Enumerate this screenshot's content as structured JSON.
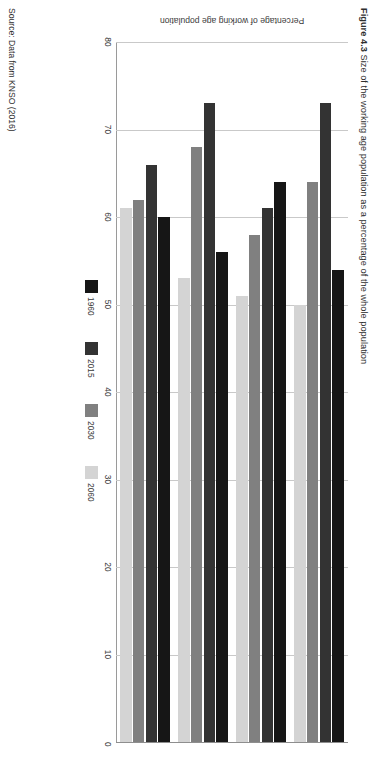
{
  "figure": {
    "caption_label": "Figure 4.3",
    "caption_text": "Size of the working age population as a percentage of the whole population",
    "source": "Source: Data from KNSO (2016)"
  },
  "chart_data": {
    "type": "bar",
    "orientation": "horizontal",
    "title": "Figure 4.3 Size of the working age population as a percentage of the whole population",
    "xlabel": "Percentage of working age population",
    "ylabel": "",
    "xlim": [
      0,
      80
    ],
    "x_reversed": true,
    "xticks": [
      80,
      70,
      60,
      50,
      40,
      30,
      20,
      10,
      0
    ],
    "xtick_labels": [
      "80",
      "70",
      "60",
      "50",
      "40",
      "30",
      "20",
      "10",
      "0"
    ],
    "grid": true,
    "legend_position": "bottom",
    "categories": [
      "Korea",
      "Japan",
      "China",
      "United States"
    ],
    "series": [
      {
        "name": "1960",
        "color": "#161616",
        "values": [
          54.0,
          64.0,
          56.0,
          60.0
        ]
      },
      {
        "name": "2015",
        "color": "#333333",
        "values": [
          73.0,
          61.0,
          73.0,
          66.0
        ]
      },
      {
        "name": "2030",
        "color": "#808080",
        "values": [
          64.0,
          58.0,
          68.0,
          62.0
        ]
      },
      {
        "name": "2060",
        "color": "#d4d4d4",
        "values": [
          50.0,
          51.0,
          53.0,
          61.0
        ]
      }
    ],
    "source": "Source: Data from KNSO (2016)"
  }
}
